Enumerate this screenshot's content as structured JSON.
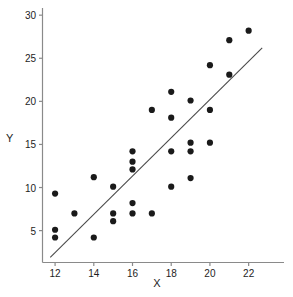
{
  "chart_data": {
    "type": "scatter",
    "title": "",
    "xlabel": "X",
    "ylabel": "Y",
    "xlim": [
      11.35,
      23.0
    ],
    "ylim": [
      1.3,
      30.6
    ],
    "xticks": [
      12,
      14,
      16,
      18,
      20,
      22
    ],
    "yticks": [
      5,
      10,
      15,
      20,
      25,
      30
    ],
    "xtick_labels": [
      "12",
      "14",
      "16",
      "18",
      "20",
      "22"
    ],
    "ytick_labels": [
      "5",
      "10",
      "15",
      "20",
      "25",
      "30"
    ],
    "grid": false,
    "legend": null,
    "point_color": "#1a1a1a",
    "point_size": 3.1,
    "line_color": "#4a4a4a",
    "axis_color": "#8a8a8a",
    "points": [
      {
        "x": 12.0,
        "y": 9.3
      },
      {
        "x": 12.0,
        "y": 5.1
      },
      {
        "x": 12.0,
        "y": 4.2
      },
      {
        "x": 13.0,
        "y": 7.0
      },
      {
        "x": 14.0,
        "y": 11.2
      },
      {
        "x": 14.0,
        "y": 4.2
      },
      {
        "x": 15.0,
        "y": 10.1
      },
      {
        "x": 15.0,
        "y": 7.0
      },
      {
        "x": 15.0,
        "y": 6.1
      },
      {
        "x": 16.0,
        "y": 14.2
      },
      {
        "x": 16.0,
        "y": 13.0
      },
      {
        "x": 16.0,
        "y": 12.1
      },
      {
        "x": 16.0,
        "y": 8.2
      },
      {
        "x": 16.0,
        "y": 7.0
      },
      {
        "x": 17.0,
        "y": 19.0
      },
      {
        "x": 17.0,
        "y": 7.0
      },
      {
        "x": 18.0,
        "y": 21.1
      },
      {
        "x": 18.0,
        "y": 18.1
      },
      {
        "x": 18.0,
        "y": 14.2
      },
      {
        "x": 18.0,
        "y": 10.1
      },
      {
        "x": 19.0,
        "y": 20.1
      },
      {
        "x": 19.0,
        "y": 15.2
      },
      {
        "x": 19.0,
        "y": 14.2
      },
      {
        "x": 19.0,
        "y": 11.1
      },
      {
        "x": 20.0,
        "y": 24.2
      },
      {
        "x": 20.0,
        "y": 19.0
      },
      {
        "x": 20.0,
        "y": 15.2
      },
      {
        "x": 21.0,
        "y": 27.1
      },
      {
        "x": 21.0,
        "y": 23.1
      },
      {
        "x": 22.0,
        "y": 28.2
      }
    ],
    "regression_line": {
      "x_start": 11.75,
      "y_start": 1.9,
      "x_end": 22.7,
      "y_end": 26.2
    }
  },
  "axis_titles": {
    "x": "X",
    "y": "Y"
  }
}
